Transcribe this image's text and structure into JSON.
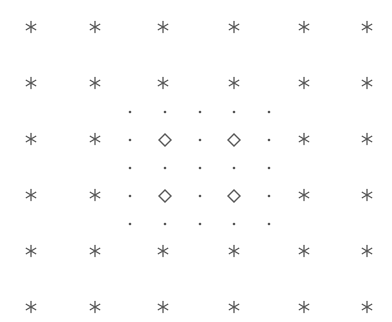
{
  "diagram": {
    "colors": {
      "background": "#ffffff",
      "marker": "#555555"
    },
    "asterisk_grid": {
      "marker": "asterisk",
      "columns_x": [
        31,
        95,
        163,
        234,
        304,
        367
      ],
      "rows_y": [
        27,
        83,
        139,
        195,
        251,
        307
      ],
      "omitted_cells": [
        [
          2,
          2
        ],
        [
          3,
          2
        ],
        [
          2,
          3
        ],
        [
          3,
          3
        ]
      ],
      "size": 11
    },
    "dot_grid": {
      "marker": "dot",
      "columns_x": [
        130,
        165,
        200,
        234,
        269
      ],
      "rows_y": [
        112,
        140,
        168,
        196,
        224
      ],
      "radius": 1.3
    },
    "diamonds": {
      "marker": "diamond",
      "points": [
        [
          165,
          140
        ],
        [
          234,
          140
        ],
        [
          165,
          196
        ],
        [
          234,
          196
        ]
      ],
      "half_size": 6
    }
  }
}
